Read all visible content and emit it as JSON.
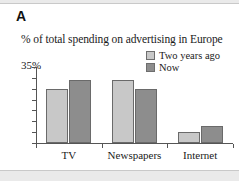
{
  "panel": {
    "letter": "A"
  },
  "legend": {
    "position": "top-right",
    "items": [
      {
        "label": "Two years ago",
        "color": "#c8c8c8",
        "swatch_name": "legend-swatch-two-years-ago"
      },
      {
        "label": "Now",
        "color": "#8d8d8d",
        "swatch_name": "legend-swatch-now"
      }
    ]
  },
  "axis": {
    "y_max_label": "35%",
    "y_ticks": [
      0,
      5,
      10,
      15,
      20,
      25,
      30,
      35
    ]
  },
  "chart_data": {
    "type": "bar",
    "title": "% of total spending on advertising in Europe",
    "xlabel": "",
    "ylabel": "",
    "ylim": [
      0,
      35
    ],
    "grid": false,
    "legend_position": "top-right",
    "categories": [
      "TV",
      "Newspapers",
      "Internet"
    ],
    "series": [
      {
        "name": "Two years ago",
        "color": "#c8c8c8",
        "values": [
          25,
          29,
          5
        ]
      },
      {
        "name": "Now",
        "color": "#8d8d8d",
        "values": [
          29,
          25,
          8
        ]
      }
    ]
  }
}
